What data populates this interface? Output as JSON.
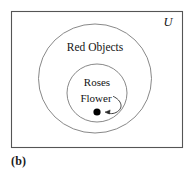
{
  "figure": {
    "caption": "(b)",
    "universe_label": "U",
    "outer_set_label": "Red Objects",
    "inner_set_label": "Roses",
    "element_label": "Flower",
    "colors": {
      "box_border": "#555555",
      "ellipse_stroke": "#7a7a7a",
      "text": "#141414",
      "point_fill": "#000000",
      "background": "#ffffff"
    },
    "geometry": {
      "box": {
        "x": 11,
        "y": 11,
        "width": 172,
        "height": 137
      },
      "outer_ellipse": {
        "cx": 95,
        "cy": 78.5,
        "rx": 57,
        "ry": 54.5
      },
      "inner_ellipse": {
        "cx": 97,
        "cy": 93,
        "rx": 30,
        "ry": 29
      },
      "point": {
        "cx": 97,
        "cy": 112,
        "r": 3.6
      }
    }
  }
}
